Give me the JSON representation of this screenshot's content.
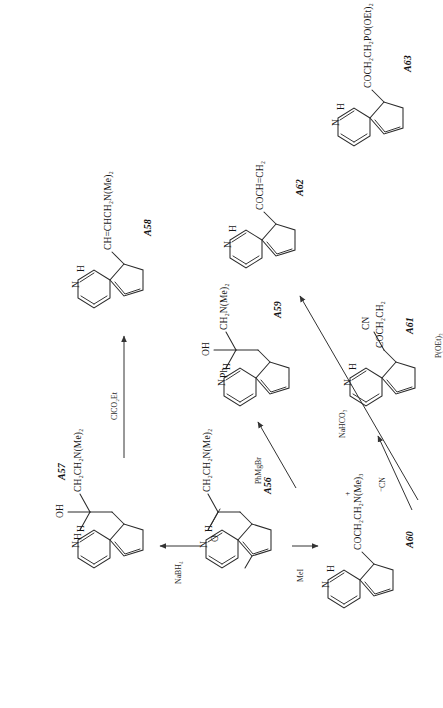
{
  "document": {
    "type": "chemical-reaction-scheme",
    "orientation": "rotated-90-counterclockwise",
    "background": "#ffffff",
    "ink_color": "#2b2b2b"
  },
  "compounds": [
    {
      "id": "A56",
      "label": "A56",
      "core": "indole",
      "position_3_substituent": "COCH₂CH₂N(Me)₂",
      "substituent_parts": [
        "O",
        "CH₂CH₂N(Me)₂"
      ],
      "nh_label": "H",
      "n_label": "N",
      "role": "starting-material"
    },
    {
      "id": "A57",
      "label": "A57",
      "core": "indole",
      "position_3_substituent": "CH(OH)CH₂CH₂N(Me)₂",
      "substituent_parts": [
        "H",
        "OH",
        "CH₂CH₂N(Me)₂"
      ],
      "nh_label": "H",
      "n_label": "N",
      "role": "product"
    },
    {
      "id": "A58",
      "label": "A58",
      "core": "indole",
      "position_3_substituent": "CH=CHCH₂N(Me)₂",
      "substituent_parts": [
        "CH=CHCH₂N(Me)₂"
      ],
      "nh_label": "H",
      "n_label": "N",
      "role": "product"
    },
    {
      "id": "A59",
      "label": "A59",
      "core": "indole",
      "position_3_substituent": "C(Ph)(OH)CH₂N(Me)₂",
      "substituent_parts": [
        "Ph",
        "OH",
        "CH₂N(Me)₂"
      ],
      "nh_label": "H",
      "n_label": "N",
      "role": "product"
    },
    {
      "id": "A60",
      "label": "A60",
      "core": "indole",
      "position_3_substituent": "COCH₂CH₂N⁺(Me)₃",
      "substituent_parts": [
        "COCH₂CH₂N(Me)₃"
      ],
      "charge": "+",
      "nh_label": "H",
      "n_label": "N",
      "role": "intermediate"
    },
    {
      "id": "A61",
      "label": "A61",
      "core": "indole",
      "position_3_substituent": "COCH₂CH₂CN",
      "substituent_parts": [
        "COCH₂CH₂",
        "CN"
      ],
      "nh_label": "H",
      "n_label": "N",
      "role": "product"
    },
    {
      "id": "A62",
      "label": "A62",
      "core": "indole",
      "position_3_substituent": "COCH=CH₂",
      "substituent_parts": [
        "COCH=CH₂"
      ],
      "nh_label": "H",
      "n_label": "N",
      "role": "product"
    },
    {
      "id": "A63",
      "label": "A63",
      "core": "indole",
      "position_3_substituent": "COCH₂CH₂PO(OEt)₂",
      "substituent_parts": [
        "COCH₂CH₂PO(OEt)₂"
      ],
      "nh_label": "H",
      "n_label": "N",
      "role": "product"
    }
  ],
  "reactions": [
    {
      "id": "r1",
      "from": "A56",
      "to": "A57",
      "reagent": "NaBH₄",
      "arrow": "straight-up"
    },
    {
      "id": "r2",
      "from": "A57",
      "to": "A58",
      "reagent": "ClCO₂Et",
      "arrow": "straight-right"
    },
    {
      "id": "r3",
      "from": "A56",
      "to": "A59",
      "reagent": "PhMgBr",
      "arrow": "diagonal-up-right"
    },
    {
      "id": "r4",
      "from": "A56",
      "to": "A60",
      "reagent": "MeI",
      "arrow": "straight-down"
    },
    {
      "id": "r5",
      "from": "A60",
      "to": "A61",
      "reagent": "⁻CN",
      "arrow": "diagonal-up-right"
    },
    {
      "id": "r6",
      "from": "A60",
      "to": "A62",
      "reagent": "NaHCO₃",
      "arrow": "diagonal-up-right"
    },
    {
      "id": "r7",
      "from": "A60",
      "to": "A63",
      "reagent": "P(OEt)₃",
      "arrow": "straight-right"
    }
  ],
  "reagent_labels": {
    "nabh4": "NaBH₄",
    "clco2et": "ClCO₂Et",
    "phmgbr": "PhMgBr",
    "mei": "MeI",
    "cyanide": "⁻CN",
    "nahco3": "NaHCO₃",
    "poet3": "P(OEt)₃"
  },
  "atom_labels": {
    "nitrogen": "N",
    "hydrogen": "H",
    "oxygen": "O",
    "hydroxyl": "OH",
    "phenyl": "Ph"
  },
  "substituent_strings": {
    "a56_chain": "CH₂CH₂N(Me)₂",
    "a56_oxygen": "O",
    "a57_h": "H",
    "a57_oh": "OH",
    "a57_chain": "CH₂CH₂N(Me)₂",
    "a58_chain": "CH=CHCH₂N(Me)₂",
    "a59_ph": "Ph",
    "a59_oh": "OH",
    "a59_chain": "CH₂N(Me)₂",
    "a60_chain": "COCH₂CH₂N(Me)₃",
    "a60_charge": "+",
    "a61_chain": "COCH₂CH₂",
    "a61_cn": "CN",
    "a62_chain": "COCH=CH₂",
    "a63_chain": "COCH₂CH₂PO(OEt)₂"
  }
}
